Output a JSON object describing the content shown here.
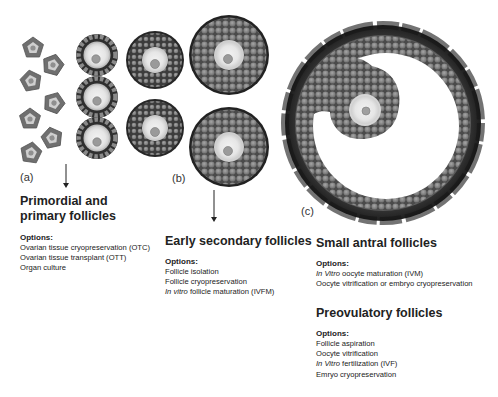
{
  "panels": {
    "a": {
      "label": "(a)",
      "title": "Primordial and primary follicles",
      "options_heading": "Options:",
      "options": [
        {
          "italic": "",
          "text": "Ovarian tissue cryopreservation (OTC)"
        },
        {
          "italic": "",
          "text": "Ovarian tissue transplant (OTT)"
        },
        {
          "italic": "",
          "text": "Organ culture"
        }
      ]
    },
    "b": {
      "label": "(b)",
      "title": "Early secondary follicles",
      "options_heading": "Options:",
      "options": [
        {
          "italic": "",
          "text": "Follicle isolation"
        },
        {
          "italic": "",
          "text": "Follicle cryopreservation"
        },
        {
          "italic": "In vitro",
          "text": " follicle maturation (IVFM)"
        }
      ]
    },
    "c": {
      "label": "(c)",
      "stages": [
        {
          "title": "Small antral follicles",
          "options_heading": "Options:",
          "options": [
            {
              "italic": "In Vitro",
              "text": " oocyte maturation (IVM)"
            },
            {
              "italic": "",
              "text": "Oocyte vitrification or embryo cryopreservation"
            }
          ]
        },
        {
          "title": "Preovulatory follicles",
          "options_heading": "Options:",
          "options": [
            {
              "italic": "",
              "text": "Follicle aspiration"
            },
            {
              "italic": "",
              "text": "Oocyte vitrification"
            },
            {
              "italic": "In Vitro",
              "text": " fertilization (IVF)"
            },
            {
              "italic": "",
              "text": "Emryo cryopreservation"
            }
          ]
        }
      ]
    }
  },
  "colors": {
    "theca_dark": "#2e2e2e",
    "granulosa": "#8a8a8a",
    "granulosa_edge": "#555555",
    "zona": "#d9d9d9",
    "oocyte": "#ededed",
    "nucleus": "#9a9a9a"
  }
}
